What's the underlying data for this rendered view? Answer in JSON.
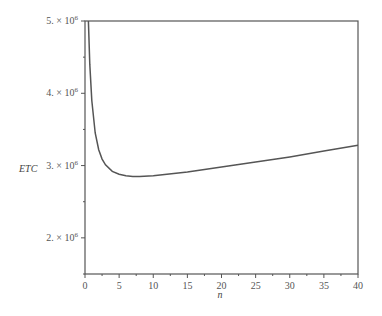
{
  "chart_data": {
    "type": "line",
    "title": "",
    "xlabel": "n",
    "ylabel": "ETC",
    "xlim": [
      0,
      40
    ],
    "ylim": [
      1500000,
      5000000
    ],
    "grid": false,
    "legend": null,
    "x_ticks": [
      0,
      5,
      10,
      15,
      20,
      25,
      30,
      35,
      40
    ],
    "x_tick_labels": [
      "0",
      "5",
      "10",
      "15",
      "20",
      "25",
      "30",
      "35",
      "40"
    ],
    "y_ticks": [
      2000000,
      3000000,
      4000000,
      5000000
    ],
    "y_tick_labels": [
      "2. × 10⁶",
      "3. × 10⁶",
      "4. × 10⁶",
      "5. × 10⁶"
    ],
    "series": [
      {
        "name": "ETC",
        "color": "#555555",
        "x": [
          0.5,
          0.7,
          1,
          1.5,
          2,
          2.5,
          3,
          4,
          5,
          6,
          7,
          8,
          10,
          12,
          15,
          20,
          25,
          30,
          35,
          40
        ],
        "values": [
          5000000,
          4400000,
          3900000,
          3450000,
          3220000,
          3090000,
          3010000,
          2920000,
          2880000,
          2860000,
          2850000,
          2850000,
          2860000,
          2880000,
          2910000,
          2980000,
          3050000,
          3120000,
          3200000,
          3280000
        ]
      }
    ]
  },
  "labels": {
    "x_axis_title": "n",
    "y_axis_title": "ETC",
    "y_tick_mantissa": [
      "2. × 10",
      "3. × 10",
      "4. × 10",
      "5. × 10"
    ],
    "y_tick_exponent": "6"
  }
}
